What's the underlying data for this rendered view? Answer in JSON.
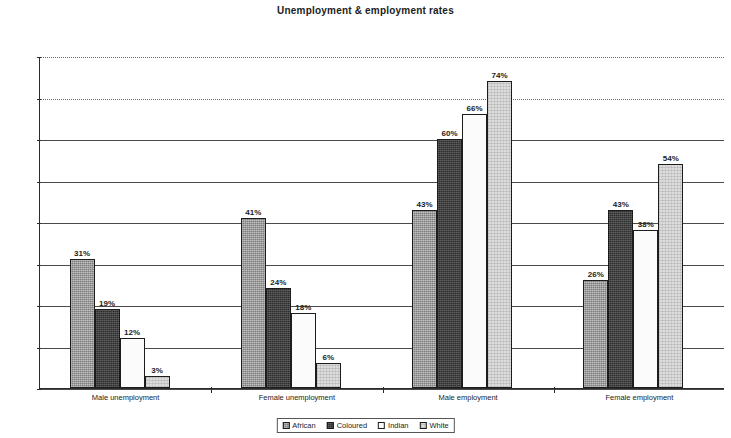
{
  "chart_data": {
    "type": "bar",
    "title": "Unemployment & employment rates",
    "xlabel": "",
    "ylabel": "",
    "ylim": [
      0,
      80
    ],
    "ytick_labels": [
      "0%",
      "10%",
      "20%",
      "30%",
      "40%",
      "50%",
      "60%",
      "70%",
      "80%"
    ],
    "ytick_values": [
      0,
      10,
      20,
      30,
      40,
      50,
      60,
      70,
      80
    ],
    "grid": true,
    "legend_position": "bottom",
    "categories": [
      "Male unemployment",
      "Female unemployment",
      "Male employment",
      "Female employment"
    ],
    "series": [
      {
        "name": "African",
        "swatch": "#7c7c7c",
        "values": [
          31,
          41,
          43,
          26
        ],
        "labels": [
          "31%",
          "41%",
          "43%",
          "26%"
        ]
      },
      {
        "name": "Coloured",
        "swatch": "#2e2e2e",
        "values": [
          19,
          24,
          60,
          43
        ],
        "labels": [
          "19%",
          "24%",
          "60%",
          "43%"
        ]
      },
      {
        "name": "Indian",
        "swatch": "#fbfbfb",
        "values": [
          12,
          18,
          66,
          38
        ],
        "labels": [
          "12%",
          "18%",
          "66%",
          "38%"
        ]
      },
      {
        "name": "White",
        "swatch": "#dcdcdc",
        "values": [
          3,
          6,
          74,
          54
        ],
        "labels": [
          "3%",
          "6%",
          "74%",
          "54%"
        ]
      }
    ]
  }
}
